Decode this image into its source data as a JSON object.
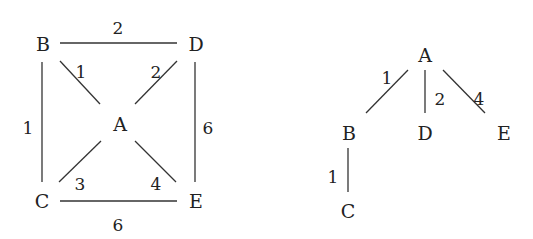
{
  "graph": {
    "nodes": [
      {
        "id": "B",
        "x": 43,
        "y": 44
      },
      {
        "id": "D",
        "x": 196,
        "y": 44
      },
      {
        "id": "A",
        "x": 120,
        "y": 124
      },
      {
        "id": "C",
        "x": 42,
        "y": 201
      },
      {
        "id": "E",
        "x": 196,
        "y": 201
      }
    ],
    "edges": [
      {
        "from": "B",
        "to": "D",
        "weight": "2",
        "x1": 60,
        "y1": 43,
        "x2": 177,
        "y2": 43,
        "lx": 118,
        "ly": 28
      },
      {
        "from": "B",
        "to": "A",
        "weight": "1",
        "x1": 60,
        "y1": 61,
        "x2": 100,
        "y2": 104,
        "lx": 81,
        "ly": 72
      },
      {
        "from": "D",
        "to": "A",
        "weight": "2",
        "x1": 177,
        "y1": 61,
        "x2": 135,
        "y2": 104,
        "lx": 156,
        "ly": 72
      },
      {
        "from": "B",
        "to": "C",
        "weight": "1",
        "x1": 42,
        "y1": 62,
        "x2": 42,
        "y2": 182,
        "lx": 28,
        "ly": 128
      },
      {
        "from": "D",
        "to": "E",
        "weight": "6",
        "x1": 195,
        "y1": 62,
        "x2": 195,
        "y2": 182,
        "lx": 208,
        "ly": 128
      },
      {
        "from": "C",
        "to": "A",
        "weight": "3",
        "x1": 59,
        "y1": 182,
        "x2": 101,
        "y2": 141,
        "lx": 80,
        "ly": 184
      },
      {
        "from": "A",
        "to": "E",
        "weight": "4",
        "x1": 135,
        "y1": 141,
        "x2": 176,
        "y2": 182,
        "lx": 156,
        "ly": 184
      },
      {
        "from": "C",
        "to": "E",
        "weight": "6",
        "x1": 60,
        "y1": 201,
        "x2": 177,
        "y2": 201,
        "lx": 118,
        "ly": 225
      }
    ]
  },
  "tree": {
    "nodes": [
      {
        "id": "A",
        "x": 425,
        "y": 55
      },
      {
        "id": "B",
        "x": 349,
        "y": 133
      },
      {
        "id": "D",
        "x": 425,
        "y": 133
      },
      {
        "id": "E",
        "x": 504,
        "y": 133
      },
      {
        "id": "C",
        "x": 348,
        "y": 211
      }
    ],
    "edges": [
      {
        "from": "A",
        "to": "B",
        "weight": "1",
        "x1": 408,
        "y1": 70,
        "x2": 366,
        "y2": 113,
        "lx": 387,
        "ly": 78
      },
      {
        "from": "A",
        "to": "D",
        "weight": "2",
        "x1": 425,
        "y1": 70,
        "x2": 425,
        "y2": 113,
        "lx": 440,
        "ly": 99
      },
      {
        "from": "A",
        "to": "E",
        "weight": "4",
        "x1": 443,
        "y1": 70,
        "x2": 485,
        "y2": 113,
        "lx": 479,
        "ly": 99
      },
      {
        "from": "B",
        "to": "C",
        "weight": "1",
        "x1": 348,
        "y1": 148,
        "x2": 348,
        "y2": 192,
        "lx": 333,
        "ly": 177
      }
    ]
  }
}
